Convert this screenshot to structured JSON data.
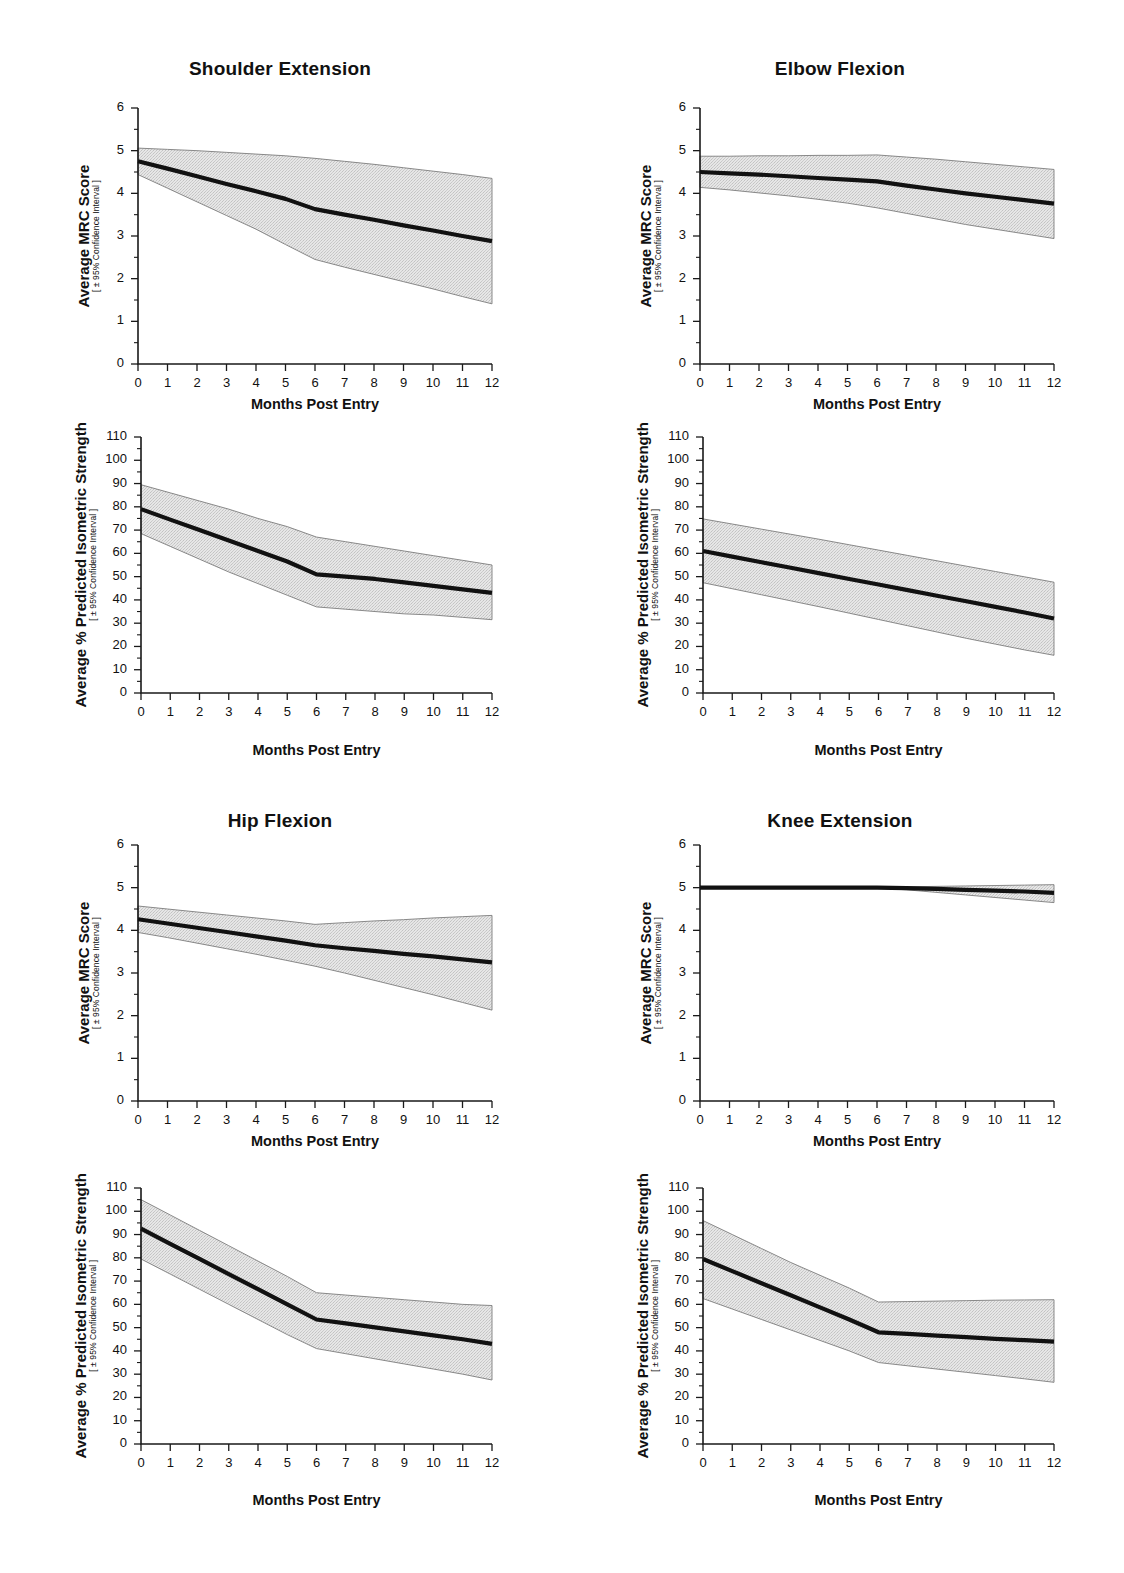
{
  "figure": {
    "width": 1124,
    "height": 1573,
    "background": "#ffffff",
    "line_color": "#111111",
    "band_color": "#dcdcdc",
    "band_edge_color": "#7d7d7d"
  },
  "axis_labels": {
    "x_title": "Months Post Entry",
    "y_title_mrc": "Average MRC Score",
    "y_title_strength": "Average % Predicted Isometric Strength",
    "y_subtitle": "[ ± 95% Confidence Interval ]",
    "x_ticks": [
      "0",
      "1",
      "2",
      "3",
      "4",
      "5",
      "6",
      "7",
      "8",
      "9",
      "10",
      "11",
      "12"
    ],
    "y_ticks_mrc": [
      "0",
      "1",
      "2",
      "3",
      "4",
      "5",
      "6"
    ],
    "y_ticks_strength": [
      "0",
      "10",
      "20",
      "30",
      "40",
      "50",
      "60",
      "70",
      "80",
      "90",
      "100",
      "110"
    ]
  },
  "panels": [
    {
      "id": "shoulder-extension",
      "title": "Shoulder Extension"
    },
    {
      "id": "elbow-flexion",
      "title": "Elbow Flexion"
    },
    {
      "id": "hip-flexion",
      "title": "Hip Flexion"
    },
    {
      "id": "knee-extension",
      "title": "Knee Extension"
    }
  ],
  "chart_data": [
    {
      "id": "shoulder-extension-mrc",
      "type": "line",
      "title": "Shoulder Extension",
      "xlabel": "Months Post Entry",
      "ylabel": "Average MRC Score",
      "ysublabel": "[ ± 95% Confidence Interval ]",
      "xlim": [
        0,
        12
      ],
      "ylim": [
        0,
        6
      ],
      "grid": false,
      "legend": "none",
      "x": [
        0,
        1,
        2,
        3,
        4,
        5,
        6,
        7,
        8,
        9,
        10,
        11,
        12
      ],
      "series": [
        {
          "name": "mean",
          "values": [
            4.75,
            4.58,
            4.4,
            4.22,
            4.05,
            3.87,
            3.63,
            3.5,
            3.38,
            3.25,
            3.13,
            3.0,
            2.88
          ]
        },
        {
          "name": "ci_upper",
          "values": [
            5.06,
            5.03,
            5.0,
            4.96,
            4.92,
            4.88,
            4.82,
            4.75,
            4.68,
            4.6,
            4.52,
            4.44,
            4.35
          ]
        },
        {
          "name": "ci_lower",
          "values": [
            4.44,
            4.12,
            3.8,
            3.48,
            3.16,
            2.8,
            2.45,
            2.27,
            2.1,
            1.93,
            1.76,
            1.58,
            1.41
          ]
        }
      ]
    },
    {
      "id": "shoulder-extension-strength",
      "type": "line",
      "title": "Shoulder Extension",
      "xlabel": "Months Post Entry",
      "ylabel": "Average % Predicted Isometric Strength",
      "ysublabel": "[ ± 95% Confidence Interval ]",
      "xlim": [
        0,
        12
      ],
      "ylim": [
        0,
        110
      ],
      "grid": false,
      "legend": "none",
      "x": [
        0,
        1,
        2,
        3,
        4,
        5,
        6,
        7,
        8,
        9,
        10,
        11,
        12
      ],
      "series": [
        {
          "name": "mean",
          "values": [
            79,
            74.5,
            70,
            65.5,
            61,
            56.5,
            51,
            50,
            49,
            47.5,
            46,
            44.5,
            43
          ]
        },
        {
          "name": "ci_upper",
          "values": [
            89.5,
            86,
            82.5,
            79,
            75,
            71.5,
            67,
            65,
            63,
            61,
            59,
            57,
            55
          ]
        },
        {
          "name": "ci_lower",
          "values": [
            68.5,
            63,
            57.5,
            52,
            47,
            42,
            37,
            36,
            35,
            34,
            33.5,
            32.5,
            31.5
          ]
        }
      ]
    },
    {
      "id": "elbow-flexion-mrc",
      "type": "line",
      "title": "Elbow Flexion",
      "xlabel": "Months Post Entry",
      "ylabel": "Average MRC Score",
      "ysublabel": "[ ± 95% Confidence Interval ]",
      "xlim": [
        0,
        12
      ],
      "ylim": [
        0,
        6
      ],
      "grid": false,
      "legend": "none",
      "x": [
        0,
        1,
        2,
        3,
        4,
        5,
        6,
        7,
        8,
        9,
        10,
        11,
        12
      ],
      "series": [
        {
          "name": "mean",
          "values": [
            4.5,
            4.47,
            4.44,
            4.4,
            4.36,
            4.32,
            4.28,
            4.18,
            4.09,
            4.0,
            3.92,
            3.84,
            3.76
          ]
        },
        {
          "name": "ci_upper",
          "values": [
            4.87,
            4.87,
            4.88,
            4.88,
            4.89,
            4.89,
            4.9,
            4.85,
            4.8,
            4.74,
            4.68,
            4.62,
            4.56
          ]
        },
        {
          "name": "ci_lower",
          "values": [
            4.14,
            4.08,
            4.01,
            3.94,
            3.86,
            3.77,
            3.66,
            3.53,
            3.4,
            3.27,
            3.16,
            3.05,
            2.94
          ]
        }
      ]
    },
    {
      "id": "elbow-flexion-strength",
      "type": "line",
      "title": "Elbow Flexion",
      "xlabel": "Months Post Entry",
      "ylabel": "Average % Predicted Isometric Strength",
      "ysublabel": "[ ± 95% Confidence Interval ]",
      "xlim": [
        0,
        12
      ],
      "ylim": [
        0,
        110
      ],
      "grid": false,
      "legend": "none",
      "x": [
        0,
        1,
        2,
        3,
        4,
        5,
        6,
        7,
        8,
        9,
        10,
        11,
        12
      ],
      "series": [
        {
          "name": "mean",
          "values": [
            61,
            58.6,
            56.2,
            53.8,
            51.4,
            49,
            46.6,
            44.2,
            41.8,
            39.4,
            37,
            34.6,
            32
          ]
        },
        {
          "name": "ci_upper",
          "values": [
            74.8,
            72.6,
            70.4,
            68.2,
            66,
            63.7,
            61.4,
            59.1,
            56.8,
            54.5,
            52.2,
            49.9,
            47.6
          ]
        },
        {
          "name": "ci_lower",
          "values": [
            47.4,
            44.8,
            42.2,
            39.6,
            37,
            34.3,
            31.6,
            28.9,
            26.2,
            23.5,
            21,
            18.5,
            16.2
          ]
        }
      ]
    },
    {
      "id": "hip-flexion-mrc",
      "type": "line",
      "title": "Hip Flexion",
      "xlabel": "Months Post Entry",
      "ylabel": "Average MRC Score",
      "ysublabel": "[ ± 95% Confidence Interval ]",
      "xlim": [
        0,
        12
      ],
      "ylim": [
        0,
        6
      ],
      "grid": false,
      "legend": "none",
      "x": [
        0,
        1,
        2,
        3,
        4,
        5,
        6,
        7,
        8,
        9,
        10,
        11,
        12
      ],
      "series": [
        {
          "name": "mean",
          "values": [
            4.26,
            4.16,
            4.06,
            3.96,
            3.86,
            3.76,
            3.65,
            3.58,
            3.52,
            3.45,
            3.39,
            3.32,
            3.25
          ]
        },
        {
          "name": "ci_upper",
          "values": [
            4.57,
            4.5,
            4.43,
            4.36,
            4.29,
            4.22,
            4.14,
            4.18,
            4.22,
            4.25,
            4.29,
            4.32,
            4.35
          ]
        },
        {
          "name": "ci_lower",
          "values": [
            3.95,
            3.83,
            3.7,
            3.57,
            3.44,
            3.3,
            3.16,
            3.0,
            2.83,
            2.66,
            2.49,
            2.31,
            2.13
          ]
        }
      ]
    },
    {
      "id": "hip-flexion-strength",
      "type": "line",
      "title": "Hip Flexion",
      "xlabel": "Months Post Entry",
      "ylabel": "Average % Predicted Isometric Strength",
      "ysublabel": "[ ± 95% Confidence Interval ]",
      "xlim": [
        0,
        12
      ],
      "ylim": [
        0,
        110
      ],
      "grid": false,
      "legend": "none",
      "x": [
        0,
        1,
        2,
        3,
        4,
        5,
        6,
        7,
        8,
        9,
        10,
        11,
        12
      ],
      "series": [
        {
          "name": "mean",
          "values": [
            92.5,
            86,
            79.5,
            73,
            66.5,
            60,
            53.5,
            51.8,
            50.1,
            48.4,
            46.7,
            45,
            43
          ]
        },
        {
          "name": "ci_upper",
          "values": [
            105,
            98.4,
            91.8,
            85.2,
            78.6,
            72,
            65,
            64,
            63,
            62,
            61,
            60,
            59.5
          ]
        },
        {
          "name": "ci_lower",
          "values": [
            79.5,
            73,
            66.5,
            60,
            53.5,
            47,
            41,
            38.8,
            36.6,
            34.4,
            32.2,
            30,
            27.5
          ]
        }
      ]
    },
    {
      "id": "knee-extension-mrc",
      "type": "line",
      "title": "Knee Extension",
      "xlabel": "Months Post Entry",
      "ylabel": "Average MRC Score",
      "ysublabel": "[ ± 95% Confidence Interval ]",
      "xlim": [
        0,
        12
      ],
      "ylim": [
        0,
        6
      ],
      "grid": false,
      "legend": "none",
      "x": [
        0,
        1,
        2,
        3,
        4,
        5,
        6,
        7,
        8,
        9,
        10,
        11,
        12
      ],
      "series": [
        {
          "name": "mean",
          "values": [
            5.0,
            5.0,
            5.0,
            5.0,
            5.0,
            5.0,
            5.0,
            4.99,
            4.97,
            4.95,
            4.93,
            4.91,
            4.88
          ]
        },
        {
          "name": "ci_upper",
          "values": [
            5.0,
            5.0,
            5.0,
            5.0,
            5.0,
            5.0,
            5.01,
            5.02,
            5.03,
            5.04,
            5.05,
            5.06,
            5.07
          ]
        },
        {
          "name": "ci_lower",
          "values": [
            5.0,
            5.0,
            5.0,
            5.0,
            5.0,
            5.0,
            4.99,
            4.95,
            4.89,
            4.83,
            4.77,
            4.71,
            4.65
          ]
        }
      ]
    },
    {
      "id": "knee-extension-strength",
      "type": "line",
      "title": "Knee Extension",
      "xlabel": "Months Post Entry",
      "ylabel": "Average % Predicted Isometric Strength",
      "ysublabel": "[ ± 95% Confidence Interval ]",
      "xlim": [
        0,
        12
      ],
      "ylim": [
        0,
        110
      ],
      "grid": false,
      "legend": "none",
      "x": [
        0,
        1,
        2,
        3,
        4,
        5,
        6,
        7,
        8,
        9,
        10,
        11,
        12
      ],
      "series": [
        {
          "name": "mean",
          "values": [
            79.5,
            74.3,
            69.1,
            63.9,
            58.7,
            53.5,
            48,
            47.3,
            46.6,
            45.9,
            45.2,
            44.6,
            44
          ]
        },
        {
          "name": "ci_upper",
          "values": [
            96,
            90,
            84,
            78,
            72.5,
            67,
            61,
            61.2,
            61.4,
            61.6,
            61.8,
            61.9,
            62
          ]
        },
        {
          "name": "ci_lower",
          "values": [
            62.5,
            58,
            53.5,
            49,
            44.5,
            40,
            35,
            33.6,
            32.2,
            30.8,
            29.4,
            28,
            26.5
          ]
        }
      ]
    }
  ]
}
